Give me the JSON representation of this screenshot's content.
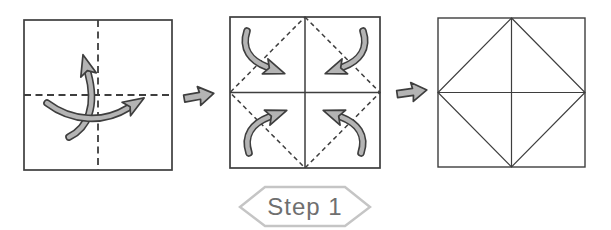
{
  "step_badge": {
    "label": "Step 1"
  },
  "colors": {
    "canvas": "#ffffff",
    "paper": "#ffffff",
    "line": "#3e3e3e",
    "arrow-fill": "#b4b4b4",
    "badge-border": "#c5c5c5",
    "badge-text": "#6f6f6f"
  },
  "panels": [
    {
      "id": "unfolded-square",
      "creases": "vertical and horizontal center creases (dashed)",
      "icons": [
        "fold-up-arrow-icon",
        "fold-right-arrow-icon"
      ]
    },
    {
      "id": "cross-creased-square",
      "creases": "solid cross creases, dashed diagonal diamond creases",
      "icons": [
        "fold-corner-top-left-arrow-icon",
        "fold-corner-top-right-arrow-icon",
        "fold-corner-bottom-left-arrow-icon",
        "fold-corner-bottom-right-arrow-icon"
      ]
    },
    {
      "id": "blintz-folded-square",
      "creases": "solid inscribed diamond with cross creases"
    }
  ],
  "connectors": [
    "next-step-arrow-icon",
    "next-step-arrow-icon"
  ]
}
